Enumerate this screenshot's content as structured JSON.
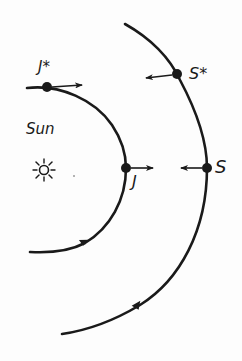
{
  "diagram": {
    "labels": {
      "sun": "Sun",
      "jupiter_star": "J*",
      "saturn_star": "S*",
      "jupiter": "J",
      "saturn": "S"
    },
    "nodes": [
      {
        "id": "sun",
        "label": "Sun",
        "x": 44,
        "y": 170,
        "shape": "sun-symbol"
      },
      {
        "id": "jupiter_star",
        "label": "J*",
        "x": 47,
        "y": 87,
        "shape": "dot",
        "velocity_arrow": "right"
      },
      {
        "id": "saturn_star",
        "label": "S*",
        "x": 177,
        "y": 74,
        "shape": "dot",
        "velocity_arrow": "left"
      },
      {
        "id": "jupiter",
        "label": "J",
        "x": 126,
        "y": 168,
        "shape": "dot",
        "velocity_arrow": "right"
      },
      {
        "id": "saturn",
        "label": "S",
        "x": 207,
        "y": 168,
        "shape": "dot",
        "velocity_arrow": "left"
      }
    ],
    "edges": [
      {
        "id": "inner-orbit",
        "description": "Jupiter orbit arc",
        "direction_arrow": "counter-clockwise (upward)"
      },
      {
        "id": "outer-orbit",
        "description": "Saturn orbit arc",
        "direction_arrow": "counter-clockwise (upward)"
      }
    ],
    "colors": {
      "ink": "#1a1a1a",
      "background": "#fdfdfd"
    }
  }
}
